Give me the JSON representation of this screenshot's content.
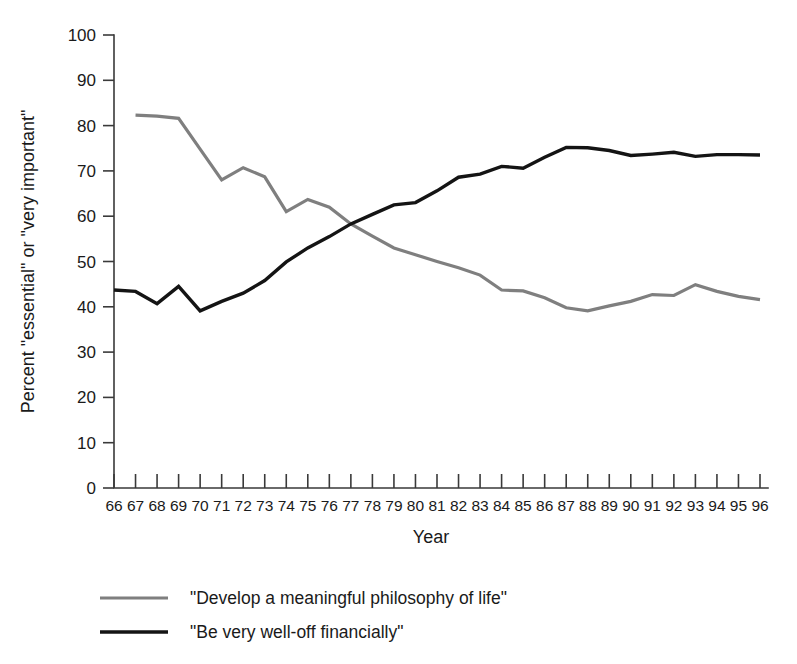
{
  "chart_data": {
    "type": "line",
    "title": "",
    "xlabel": "Year",
    "ylabel": "Percent \"essential\" or \"very important\"",
    "xlim": [
      66,
      96
    ],
    "ylim": [
      0,
      100
    ],
    "grid": false,
    "legend_position": "bottom-left",
    "x": [
      66,
      67,
      68,
      69,
      70,
      71,
      72,
      73,
      74,
      75,
      76,
      77,
      78,
      79,
      80,
      81,
      82,
      83,
      84,
      85,
      86,
      87,
      88,
      89,
      90,
      91,
      92,
      93,
      94,
      95,
      96
    ],
    "xtick_labels": [
      "66",
      "67",
      "68",
      "69",
      "70",
      "71",
      "72",
      "73",
      "74",
      "75",
      "76",
      "77",
      "78",
      "79",
      "80",
      "81",
      "82",
      "83",
      "84",
      "85",
      "86",
      "87",
      "88",
      "89",
      "90",
      "91",
      "92",
      "93",
      "94",
      "95",
      "96"
    ],
    "ytick_labels": [
      "0",
      "10",
      "20",
      "30",
      "40",
      "50",
      "60",
      "70",
      "80",
      "90",
      "100"
    ],
    "yticks": [
      0,
      10,
      20,
      30,
      40,
      50,
      60,
      70,
      80,
      90,
      100
    ],
    "series": [
      {
        "name": "\"Develop a meaningful philosophy of life\"",
        "color": "#7f7f7f",
        "width": 3.2,
        "x": [
          67,
          68,
          69,
          70,
          71,
          72,
          73,
          74,
          75,
          76,
          77,
          78,
          79,
          80,
          81,
          82,
          83,
          84,
          85,
          86,
          87,
          88,
          89,
          90,
          91,
          92,
          93,
          94,
          95,
          96
        ],
        "values": [
          82.3,
          82.1,
          81.6,
          74.8,
          68.0,
          70.7,
          68.7,
          61.0,
          63.7,
          62.0,
          58.3,
          55.6,
          53.0,
          51.5,
          50.0,
          48.6,
          47.0,
          43.7,
          43.5,
          42.0,
          39.8,
          39.1,
          40.2,
          41.2,
          42.7,
          42.5,
          44.9,
          43.4,
          42.3,
          41.6
        ]
      },
      {
        "name": "\"Be very well-off financially\"",
        "color": "#141414",
        "width": 3.4,
        "x": [
          66,
          67,
          68,
          69,
          70,
          71,
          72,
          73,
          74,
          75,
          76,
          77,
          78,
          79,
          80,
          81,
          82,
          83,
          84,
          85,
          86,
          87,
          88,
          89,
          90,
          91,
          92,
          93,
          94,
          95,
          96
        ],
        "values": [
          43.7,
          43.4,
          40.7,
          44.5,
          39.1,
          41.2,
          43.0,
          45.8,
          49.9,
          53.0,
          55.5,
          58.3,
          60.4,
          62.5,
          63.0,
          65.6,
          68.6,
          69.3,
          71.0,
          70.6,
          73.0,
          75.2,
          75.1,
          74.5,
          73.4,
          73.7,
          74.1,
          73.2,
          73.6,
          73.6,
          73.5
        ]
      }
    ]
  },
  "legend": {
    "items": [
      {
        "label": "\"Develop a meaningful philosophy of life\"",
        "color": "#7f7f7f"
      },
      {
        "label": "\"Be very well-off financially\"",
        "color": "#141414"
      }
    ]
  }
}
